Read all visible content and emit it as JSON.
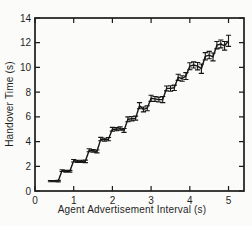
{
  "figure": {
    "background": "#fbfbf9",
    "axis_color": "#1c1c1c",
    "line_color": "#161616",
    "text_color": "#1f1f1f"
  },
  "chart_data": {
    "type": "line",
    "title": "",
    "xlabel": "Agent Advertisement Interval (s)",
    "ylabel": "Handover Time (s)",
    "xlim": [
      0,
      5.4
    ],
    "ylim": [
      0,
      14
    ],
    "xticks": [
      0,
      1,
      2,
      3,
      4,
      5
    ],
    "yticks": [
      0,
      2,
      4,
      6,
      8,
      10,
      12,
      14
    ],
    "grid": false,
    "legend": null,
    "series": [
      {
        "name": "handover-time",
        "style": "line-with-error-bars",
        "x": [
          0.4,
          0.5,
          0.6,
          0.7,
          0.8,
          0.9,
          1.0,
          1.1,
          1.2,
          1.3,
          1.4,
          1.5,
          1.6,
          1.7,
          1.8,
          1.9,
          2.0,
          2.1,
          2.2,
          2.3,
          2.4,
          2.5,
          2.6,
          2.7,
          2.8,
          2.9,
          3.0,
          3.1,
          3.2,
          3.3,
          3.4,
          3.5,
          3.6,
          3.7,
          3.8,
          3.9,
          4.0,
          4.1,
          4.2,
          4.3,
          4.4,
          4.5,
          4.6,
          4.7,
          4.8,
          4.9,
          5.0
        ],
        "y": [
          0.8,
          0.8,
          0.8,
          1.65,
          1.6,
          1.6,
          2.45,
          2.4,
          2.4,
          2.4,
          3.3,
          3.25,
          3.2,
          4.2,
          4.15,
          4.2,
          5.0,
          5.0,
          5.05,
          4.9,
          5.8,
          5.85,
          5.9,
          6.9,
          6.6,
          6.7,
          7.5,
          7.45,
          7.4,
          7.4,
          8.3,
          8.3,
          8.35,
          9.2,
          9.1,
          9.3,
          10.1,
          10.2,
          10.1,
          9.9,
          10.9,
          11.0,
          10.85,
          11.8,
          11.9,
          11.75,
          12.15
        ],
        "yerr": [
          0.05,
          0.05,
          0.06,
          0.07,
          0.07,
          0.07,
          0.1,
          0.09,
          0.09,
          0.1,
          0.12,
          0.1,
          0.12,
          0.14,
          0.12,
          0.13,
          0.15,
          0.13,
          0.14,
          0.16,
          0.2,
          0.18,
          0.16,
          0.25,
          0.2,
          0.2,
          0.25,
          0.2,
          0.2,
          0.25,
          0.2,
          0.22,
          0.22,
          0.25,
          0.22,
          0.28,
          0.28,
          0.25,
          0.3,
          0.38,
          0.3,
          0.3,
          0.32,
          0.3,
          0.32,
          0.35,
          0.45
        ]
      }
    ]
  }
}
